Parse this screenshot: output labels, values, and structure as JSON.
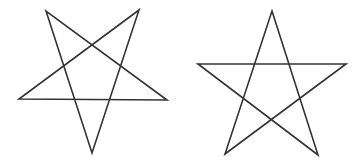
{
  "figure": {
    "background": "#ffffff",
    "stroke_color": "#333333",
    "stroke_width": 1.6,
    "shapes": [
      {
        "id": "inverted-star",
        "type": "pentagram",
        "orientation": "point-down",
        "points": [
          [
            46,
            11
          ],
          [
            92,
            153
          ],
          [
            139,
            10
          ],
          [
            19,
            99
          ],
          [
            167,
            100
          ]
        ]
      },
      {
        "id": "upright-star",
        "type": "pentagram",
        "orientation": "point-up",
        "points": [
          [
            272,
            11
          ],
          [
            318,
            155
          ],
          [
            198,
            64
          ],
          [
            346,
            64
          ],
          [
            225,
            154
          ]
        ]
      }
    ]
  }
}
